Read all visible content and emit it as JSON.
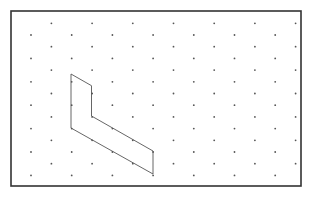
{
  "figure": {
    "type": "isometric-dot-grid",
    "frame": {
      "x": 11,
      "y": 11,
      "width": 290,
      "height": 175,
      "stroke": "#333333",
      "stroke_width": 1.6
    },
    "grid": {
      "origin_x": 31,
      "origin_y": 23.3,
      "col_spacing": 20.35,
      "row_spacing": 11.7,
      "cols": 14,
      "rows": 14,
      "dot_color": "#555555",
      "dot_radius": 0.9
    },
    "shape": {
      "name": "L-shaped polygon",
      "stroke": "#555555",
      "stroke_width": 0.9,
      "fill": "none",
      "vertices": [
        [
          71,
          74
        ],
        [
          91.5,
          85.7
        ],
        [
          91.5,
          116
        ],
        [
          153,
          151
        ],
        [
          153,
          174
        ],
        [
          71,
          128
        ]
      ]
    }
  }
}
